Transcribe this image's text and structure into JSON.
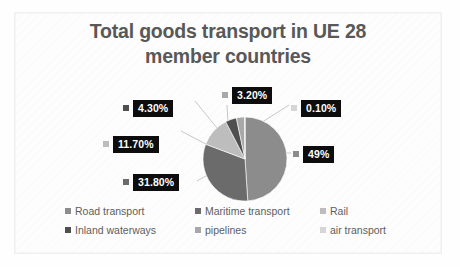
{
  "chart_data": {
    "type": "pie",
    "title": "Total goods transport in UE 28 member countries",
    "title_line1": "Total goods transport in UE 28",
    "title_line2": "member countries",
    "xlabel": "",
    "ylabel": "",
    "legend_position": "bottom",
    "grid": false,
    "units": "percent",
    "categories": [
      "Road transport",
      "Maritime transport",
      "Rail",
      "Inland waterways",
      "pipelines",
      "air transport"
    ],
    "values": [
      49,
      31.8,
      11.7,
      4.3,
      3.2,
      0.1
    ],
    "data_labels": [
      "49%",
      "31.80%",
      "11.70%",
      "4.30%",
      "3.20%",
      "0.10%"
    ],
    "colors": [
      "#8c8c8c",
      "#6b6b6b",
      "#bdbdbd",
      "#4f4f4f",
      "#a8a8a8",
      "#d6d6d6"
    ],
    "slices": [
      {
        "name": "Road transport",
        "value": 49,
        "label": "49%",
        "color": "#8c8c8c"
      },
      {
        "name": "Maritime transport",
        "value": 31.8,
        "label": "31.80%",
        "color": "#6b6b6b"
      },
      {
        "name": "Rail",
        "value": 11.7,
        "label": "11.70%",
        "color": "#bdbdbd"
      },
      {
        "name": "Inland waterways",
        "value": 4.3,
        "label": "4.30%",
        "color": "#4f4f4f"
      },
      {
        "name": "pipelines",
        "value": 3.2,
        "label": "3.20%",
        "color": "#a8a8a8"
      },
      {
        "name": "air transport",
        "value": 0.1,
        "label": "0.10%",
        "color": "#d6d6d6"
      }
    ]
  },
  "title": {
    "line1": "Total goods transport in UE 28",
    "line2": "member countries"
  },
  "labels": {
    "road": "49%",
    "maritime": "31.80%",
    "rail": "11.70%",
    "inland": "4.30%",
    "pipelines": "3.20%",
    "air": "0.10%"
  },
  "legend": {
    "row1": [
      {
        "label": "Road transport",
        "color": "#8c8c8c"
      },
      {
        "label": "Maritime transport",
        "color": "#6b6b6b"
      },
      {
        "label": "Rail",
        "color": "#bdbdbd"
      }
    ],
    "row2": [
      {
        "label": "Inland waterways",
        "color": "#4f4f4f"
      },
      {
        "label": "pipelines",
        "color": "#a8a8a8"
      },
      {
        "label": "air transport",
        "color": "#d6d6d6"
      }
    ]
  }
}
